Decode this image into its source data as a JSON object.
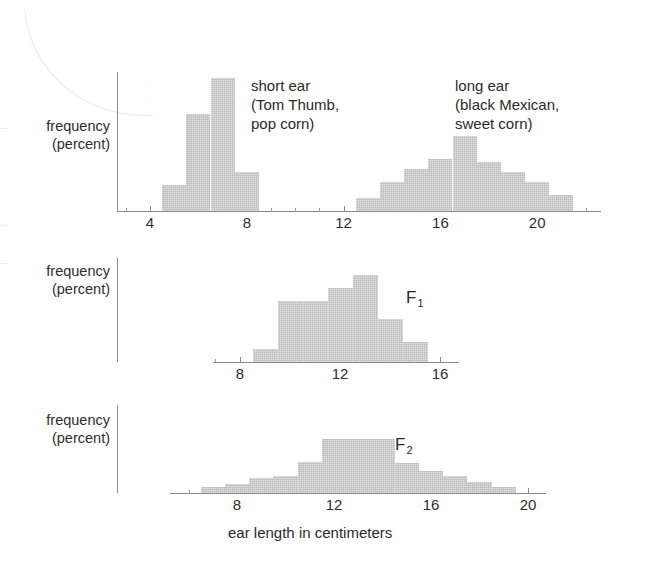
{
  "figure": {
    "x_axis_title": "ear length in centimeters",
    "y_axis_label_line1": "frequency",
    "y_axis_label_line2": "(percent)",
    "bar_color": "#bcbcbc",
    "axis_color": "#8a8a8a"
  },
  "chart_data": [
    {
      "type": "bar",
      "id": "parental",
      "title": "",
      "xlabel": "ear length in centimeters",
      "ylabel": "frequency (percent)",
      "xlim": [
        3,
        23
      ],
      "ylim": [
        0,
        44
      ],
      "grid": false,
      "legend": "inline-annotation",
      "tick_interval": 1,
      "label_interval": 4,
      "tick_labels": [
        "4",
        "8",
        "12",
        "16",
        "20"
      ],
      "tick_values": [
        4,
        8,
        12,
        16,
        20
      ],
      "annotations": [
        {
          "id": "short-ear",
          "lines": [
            "short ear",
            "(Tom Thumb,",
            "pop corn)"
          ]
        },
        {
          "id": "long-ear",
          "lines": [
            "long ear",
            "(black Mexican,",
            "sweet corn)"
          ]
        }
      ],
      "series": [
        {
          "name": "short ear (Tom Thumb, pop corn)",
          "x": [
            5,
            6,
            7,
            8
          ],
          "values": [
            8,
            30,
            41,
            12
          ]
        },
        {
          "name": "long ear (black Mexican, sweet corn)",
          "x": [
            13,
            14,
            15,
            16,
            17,
            18,
            19,
            20,
            21
          ],
          "values": [
            4,
            9,
            13,
            16,
            23,
            15,
            12,
            9,
            5
          ]
        }
      ]
    },
    {
      "type": "bar",
      "id": "f1",
      "title": "F1",
      "xlabel": "",
      "ylabel": "frequency (percent)",
      "xlim": [
        7,
        17
      ],
      "ylim": [
        0,
        36
      ],
      "grid": false,
      "tick_interval": 1,
      "label_interval": 4,
      "tick_labels": [
        "8",
        "12",
        "16"
      ],
      "tick_values": [
        8,
        12,
        16
      ],
      "annotations": [
        {
          "id": "f1-label",
          "text": "F",
          "subscript": "1"
        }
      ],
      "series": [
        {
          "name": "F1",
          "x": [
            9,
            10,
            11,
            12,
            13,
            14,
            15
          ],
          "values": [
            5,
            24,
            24,
            29,
            34,
            17,
            8
          ]
        }
      ]
    },
    {
      "type": "bar",
      "id": "f2",
      "title": "F2",
      "xlabel": "ear length in centimeters",
      "ylabel": "frequency (percent)",
      "xlim": [
        6,
        21
      ],
      "ylim": [
        0,
        36
      ],
      "grid": false,
      "tick_interval": 1,
      "label_interval": 4,
      "tick_labels": [
        "8",
        "12",
        "16",
        "20"
      ],
      "tick_values": [
        8,
        12,
        16,
        20
      ],
      "annotations": [
        {
          "id": "f2-label",
          "text": "F",
          "subscript": "2"
        }
      ],
      "series": [
        {
          "name": "F2",
          "x": [
            7,
            8,
            9,
            10,
            11,
            12,
            13,
            14,
            15,
            16,
            17,
            18,
            19
          ],
          "values": [
            3,
            5,
            8,
            9,
            17,
            29,
            29,
            29,
            16,
            12,
            9,
            6,
            3
          ]
        }
      ]
    }
  ]
}
